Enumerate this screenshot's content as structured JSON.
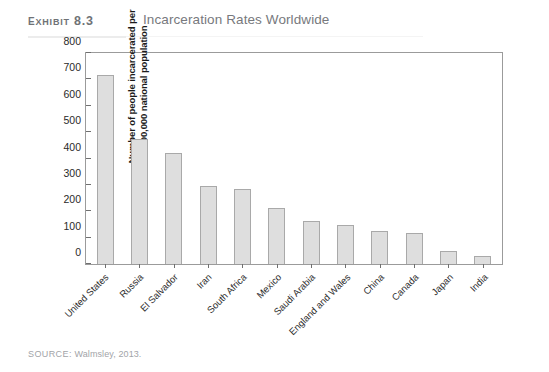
{
  "header": {
    "exhibit_label": "Exhibit 8.3",
    "title": "Incarceration Rates Worldwide"
  },
  "source": {
    "keyword": "SOURCE:",
    "text": "Walmsley, 2013."
  },
  "colors": {
    "bar_fill": "#dedede",
    "bar_border": "#a9a9a9",
    "axis": "#9b9b9b",
    "title_text": "#77797d",
    "label_text": "#6f7276",
    "source_text": "#a2a4a8"
  },
  "chart_data": {
    "type": "bar",
    "title": "Incarceration Rates Worldwide",
    "xlabel": "",
    "ylabel": "Number of people incarcerated per 100,000 national population",
    "ylim": [
      0,
      800
    ],
    "yticks": [
      0,
      100,
      200,
      300,
      400,
      500,
      600,
      700,
      800
    ],
    "grid": false,
    "legend": "none",
    "categories": [
      "United States",
      "Russia",
      "El Salvador",
      "Iran",
      "South Africa",
      "Mexico",
      "Saudi Arabia",
      "England and Wales",
      "China",
      "Canada",
      "Japan",
      "India"
    ],
    "values": [
      716,
      475,
      422,
      295,
      285,
      214,
      162,
      148,
      124,
      118,
      51,
      30
    ]
  }
}
